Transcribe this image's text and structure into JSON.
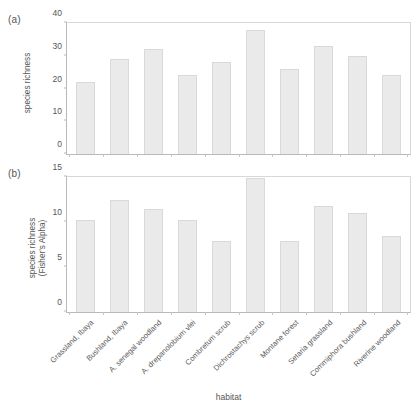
{
  "figure": {
    "background": "#ffffff",
    "bar_fill": "#eaeaea",
    "bar_border": "#d9d9d9",
    "axis_color": "#b9b9b9",
    "text_color": "#555555",
    "xlabel": "habitat",
    "panel_a_tag": "(a)",
    "panel_b_tag": "(b)"
  },
  "chart_data": [
    {
      "type": "bar",
      "panel": "(a)",
      "title": "",
      "xlabel": "habitat",
      "ylabel": "species richness",
      "ylim": [
        0,
        40
      ],
      "yticks": [
        0,
        10,
        20,
        30,
        40
      ],
      "grid": false,
      "legend": false,
      "categories": [
        "Grassland, Ibaya",
        "Bushland, Ibaya",
        "A. senegal woodland",
        "A. drepanolobium vlei",
        "Combretum scrub",
        "Dichrostachys scrub",
        "Montane forest",
        "Setaria grassland",
        "Commiphora bushland",
        "Riverine woodland"
      ],
      "values": [
        22,
        29,
        32,
        24,
        28,
        38,
        26,
        33,
        30,
        24
      ]
    },
    {
      "type": "bar",
      "panel": "(b)",
      "title": "",
      "xlabel": "habitat",
      "ylabel": "species richness\n(Fisher's Alpha)",
      "ylim": [
        0,
        15
      ],
      "yticks": [
        0,
        5,
        10,
        15
      ],
      "grid": false,
      "legend": false,
      "categories": [
        "Grassland, Ibaya",
        "Bushland, Ibaya",
        "A. senegal woodland",
        "A. drepanolobium vlei",
        "Combretum scrub",
        "Dichrostachys scrub",
        "Montane forest",
        "Setaria grassland",
        "Commiphora bushland",
        "Riverine woodland"
      ],
      "values": [
        10.2,
        12.4,
        11.4,
        10.2,
        7.9,
        14.9,
        7.9,
        11.8,
        11.0,
        8.4
      ]
    }
  ]
}
